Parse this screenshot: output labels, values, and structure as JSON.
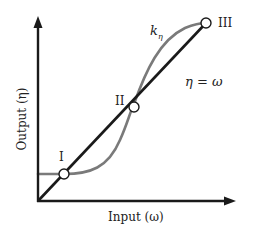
{
  "diagram": {
    "type": "line_diagram",
    "axes": {
      "x_label": "Input (ω)",
      "y_label": "Output (η)"
    },
    "curves": [
      {
        "name": "k_eta",
        "label_main": "k",
        "label_sub": "η",
        "color": "#7a7a7a",
        "shape": "flat-then-S-curve"
      },
      {
        "name": "identity",
        "label": "η = ω",
        "color": "#1a1a1a",
        "shape": "straight line through origin"
      }
    ],
    "intersection_points": [
      {
        "id": "I",
        "label": "I"
      },
      {
        "id": "II",
        "label": "II"
      },
      {
        "id": "III",
        "label": "III"
      }
    ],
    "colors": {
      "axis": "#1a1a1a",
      "identity_line": "#1a1a1a",
      "k_curve": "#7a7a7a",
      "point_fill": "#ffffff",
      "point_stroke": "#1a1a1a"
    }
  }
}
